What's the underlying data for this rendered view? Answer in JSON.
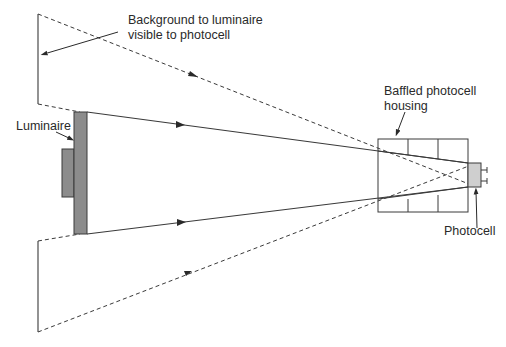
{
  "diagram": {
    "labels": {
      "background": [
        "Background to luminaire",
        "visible to photocell"
      ],
      "luminaire": "Luminaire",
      "housing": [
        "Baffled photocell",
        "housing"
      ],
      "photocell": "Photocell"
    },
    "colors": {
      "line": "#3a3a3a",
      "luminaire_fill": "#8c8c8c",
      "photocell_fill": "#cfcfcf",
      "housing_fill": "#ffffff"
    }
  }
}
